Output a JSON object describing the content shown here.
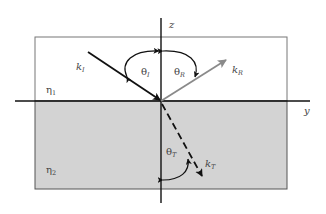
{
  "diagram": {
    "axes": {
      "z": "z",
      "y": "y"
    },
    "media": {
      "upper": {
        "label": "η",
        "sub": "1",
        "fill": "#ffffff"
      },
      "lower": {
        "label": "η",
        "sub": "2",
        "fill": "#d3d3d3"
      }
    },
    "rays": {
      "incident": {
        "label": "k",
        "sub": "I",
        "color": "#111111",
        "style": "solid"
      },
      "reflected": {
        "label": "k",
        "sub": "R",
        "color": "#8a8a8a",
        "style": "solid"
      },
      "transmitted": {
        "label": "k",
        "sub": "T",
        "color": "#111111",
        "style": "dashed"
      }
    },
    "angles": {
      "incident": {
        "label": "θ",
        "sub": "I"
      },
      "reflected": {
        "label": "θ",
        "sub": "R"
      },
      "transmitted": {
        "label": "θ",
        "sub": "T"
      }
    }
  }
}
